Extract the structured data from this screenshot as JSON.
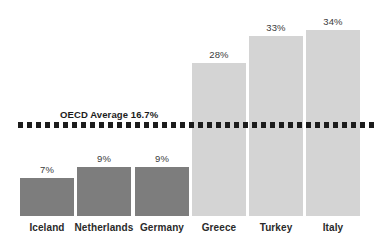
{
  "chart_data": {
    "type": "bar",
    "title": "",
    "subtitle": "",
    "xlabel": "",
    "ylabel": "",
    "ylim": [
      0,
      36
    ],
    "grid": false,
    "legend": "none",
    "categories": [
      "Iceland",
      "Netherlands",
      "Germany",
      "Greece",
      "Turkey",
      "Italy"
    ],
    "values": [
      7,
      9,
      9,
      28,
      33,
      34
    ],
    "value_labels": [
      "7%",
      "9%",
      "9%",
      "28%",
      "33%",
      "34%"
    ],
    "bar_colors": [
      "#7d7d7d",
      "#7d7d7d",
      "#7d7d7d",
      "#d4d4d4",
      "#d4d4d4",
      "#d4d4d4"
    ],
    "annotations": [
      {
        "name": "oecd-average-line",
        "label": "OECD Average 16.7%",
        "value": 16.7,
        "style": "dotted",
        "color": "#1c1c1c"
      }
    ]
  },
  "colors": {
    "background": "#ffffff",
    "bar_dark": "#7d7d7d",
    "bar_light": "#d4d4d4",
    "reference_line": "#1c1c1c",
    "value_text": "#3b3b3b",
    "category_text": "#2a2a2a"
  }
}
